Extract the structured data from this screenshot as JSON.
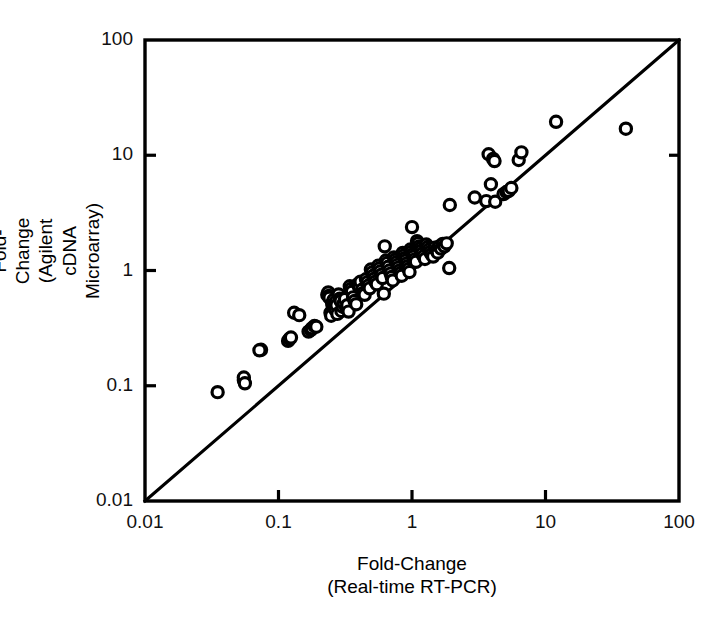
{
  "chart_data": {
    "type": "scatter",
    "title": "",
    "xlabel": "Fold-Change",
    "xlabel_line2": "(Real-time RT-PCR)",
    "ylabel": "Fold-Change",
    "ylabel_line2": "(Agilent cDNA Microarray)",
    "xscale": "log",
    "yscale": "log",
    "xlim": [
      0.01,
      100
    ],
    "ylim": [
      0.01,
      100
    ],
    "grid": false,
    "legend": "none",
    "marker": "open-circle",
    "marker_color": "#000000",
    "marker_fill": "#ffffff",
    "line_color": "#000000",
    "axis_color": "#000000",
    "xticks": [
      0.01,
      0.1,
      1,
      10,
      100
    ],
    "xticklabels": [
      "0.01",
      "0.1",
      "1",
      "10",
      "100"
    ],
    "yticks": [
      0.01,
      0.1,
      1,
      10,
      100
    ],
    "yticklabels": [
      "0.01",
      "0.1",
      "1",
      "10",
      "100"
    ],
    "annotations": [
      {
        "name": "identity-line",
        "from": [
          0.01,
          0.01
        ],
        "to": [
          100,
          100
        ],
        "description": "y = x reference line"
      }
    ],
    "series": [
      {
        "name": "Genes",
        "points": [
          [
            0.035,
            0.088
          ],
          [
            0.055,
            0.112
          ],
          [
            0.055,
            0.118
          ],
          [
            0.056,
            0.105
          ],
          [
            0.074,
            0.205
          ],
          [
            0.072,
            0.203
          ],
          [
            0.118,
            0.245
          ],
          [
            0.121,
            0.255
          ],
          [
            0.124,
            0.262
          ],
          [
            0.131,
            0.43
          ],
          [
            0.143,
            0.41
          ],
          [
            0.168,
            0.295
          ],
          [
            0.175,
            0.305
          ],
          [
            0.178,
            0.315
          ],
          [
            0.186,
            0.33
          ],
          [
            0.192,
            0.325
          ],
          [
            0.232,
            0.615
          ],
          [
            0.236,
            0.645
          ],
          [
            0.238,
            0.6
          ],
          [
            0.241,
            0.58
          ],
          [
            0.245,
            0.43
          ],
          [
            0.248,
            0.405
          ],
          [
            0.252,
            0.52
          ],
          [
            0.255,
            0.49
          ],
          [
            0.258,
            0.555
          ],
          [
            0.262,
            0.505
          ],
          [
            0.265,
            0.46
          ],
          [
            0.268,
            0.535
          ],
          [
            0.272,
            0.5
          ],
          [
            0.276,
            0.42
          ],
          [
            0.282,
            0.62
          ],
          [
            0.288,
            0.57
          ],
          [
            0.292,
            0.545
          ],
          [
            0.296,
            0.445
          ],
          [
            0.302,
            0.485
          ],
          [
            0.308,
            0.52
          ],
          [
            0.315,
            0.565
          ],
          [
            0.322,
            0.47
          ],
          [
            0.328,
            0.5
          ],
          [
            0.335,
            0.44
          ],
          [
            0.342,
            0.73
          ],
          [
            0.348,
            0.69
          ],
          [
            0.355,
            0.655
          ],
          [
            0.362,
            0.585
          ],
          [
            0.372,
            0.545
          ],
          [
            0.382,
            0.51
          ],
          [
            0.392,
            0.76
          ],
          [
            0.402,
            0.72
          ],
          [
            0.412,
            0.8
          ],
          [
            0.422,
            0.68
          ],
          [
            0.432,
            0.64
          ],
          [
            0.442,
            0.615
          ],
          [
            0.452,
            0.84
          ],
          [
            0.462,
            0.79
          ],
          [
            0.472,
            0.74
          ],
          [
            0.482,
            0.7
          ],
          [
            0.492,
            1.02
          ],
          [
            0.502,
            0.96
          ],
          [
            0.512,
            0.9
          ],
          [
            0.522,
            0.85
          ],
          [
            0.532,
            0.8
          ],
          [
            0.545,
            0.76
          ],
          [
            0.558,
            1.1
          ],
          [
            0.568,
            1.04
          ],
          [
            0.578,
            0.98
          ],
          [
            0.592,
            0.92
          ],
          [
            0.602,
            0.86
          ],
          [
            0.615,
            0.63
          ],
          [
            0.625,
            1.62
          ],
          [
            0.638,
            1.22
          ],
          [
            0.652,
            1.16
          ],
          [
            0.665,
            1.08
          ],
          [
            0.678,
            1.0
          ],
          [
            0.692,
            0.94
          ],
          [
            0.705,
            0.88
          ],
          [
            0.718,
            0.82
          ],
          [
            0.732,
            1.3
          ],
          [
            0.748,
            1.24
          ],
          [
            0.762,
            1.18
          ],
          [
            0.778,
            1.12
          ],
          [
            0.792,
            1.06
          ],
          [
            0.808,
            1.0
          ],
          [
            0.822,
            0.95
          ],
          [
            0.838,
            0.9
          ],
          [
            0.852,
            1.42
          ],
          [
            0.868,
            1.35
          ],
          [
            0.882,
            1.28
          ],
          [
            0.898,
            1.22
          ],
          [
            0.912,
            1.15
          ],
          [
            0.928,
            1.09
          ],
          [
            0.942,
            1.03
          ],
          [
            0.958,
            0.97
          ],
          [
            0.972,
            1.52
          ],
          [
            0.988,
            1.45
          ],
          [
            1.0,
            2.38
          ],
          [
            1.01,
            1.38
          ],
          [
            1.03,
            1.32
          ],
          [
            1.05,
            1.25
          ],
          [
            1.07,
            1.19
          ],
          [
            1.09,
            1.8
          ],
          [
            1.11,
            1.72
          ],
          [
            1.13,
            1.62
          ],
          [
            1.15,
            1.55
          ],
          [
            1.17,
            1.48
          ],
          [
            1.19,
            1.4
          ],
          [
            1.22,
            1.33
          ],
          [
            1.25,
            1.26
          ],
          [
            1.28,
            1.68
          ],
          [
            1.31,
            1.6
          ],
          [
            1.34,
            1.52
          ],
          [
            1.37,
            1.45
          ],
          [
            1.4,
            1.38
          ],
          [
            1.44,
            1.32
          ],
          [
            1.48,
            1.58
          ],
          [
            1.52,
            1.5
          ],
          [
            1.56,
            1.43
          ],
          [
            1.6,
            1.62
          ],
          [
            1.65,
            1.55
          ],
          [
            1.7,
            1.7
          ],
          [
            1.75,
            1.62
          ],
          [
            1.82,
            1.72
          ],
          [
            1.9,
            1.05
          ],
          [
            1.92,
            3.7
          ],
          [
            2.95,
            4.3
          ],
          [
            3.6,
            4.0
          ],
          [
            3.75,
            10.2
          ],
          [
            3.9,
            5.6
          ],
          [
            4.05,
            9.3
          ],
          [
            4.15,
            8.9
          ],
          [
            4.2,
            3.95
          ],
          [
            4.85,
            4.6
          ],
          [
            5.1,
            4.8
          ],
          [
            5.3,
            4.9
          ],
          [
            5.55,
            5.2
          ],
          [
            6.3,
            9.1
          ],
          [
            6.6,
            10.6
          ],
          [
            12.0,
            19.5
          ],
          [
            40.0,
            17.0
          ]
        ]
      }
    ]
  },
  "ticks": {
    "x": [
      "0.01",
      "0.1",
      "1",
      "10",
      "100"
    ],
    "y": [
      "0.01",
      "0.1",
      "1",
      "10",
      "100"
    ]
  },
  "labels": {
    "x_line1": "Fold-Change",
    "x_line2": "(Real-time RT-PCR)",
    "y_line1": "Fold-Change",
    "y_line2": "(Agilent cDNA Microarray)"
  }
}
